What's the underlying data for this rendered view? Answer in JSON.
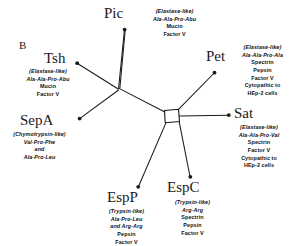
{
  "figure": {
    "panel_label": "B",
    "type": "unrooted-phylogenetic-tree",
    "line_color": "#1a1a1a",
    "text_color": "#111111"
  },
  "taxa": [
    {
      "id": "pic",
      "name": "Pic",
      "annotation": [
        "(Elastase-like)",
        "Ala-Ala-Pro-Abu",
        "Mucin",
        "Factor V"
      ],
      "italic_lines": [
        0,
        1
      ]
    },
    {
      "id": "tsh",
      "name": "Tsh",
      "annotation": [
        "(Elastase-like)",
        "Ala-Ala-Pro-Abu",
        "Mucin",
        "Factor V"
      ],
      "italic_lines": [
        0,
        1
      ]
    },
    {
      "id": "sepa",
      "name": "SepA",
      "annotation": [
        "(Chymotrypsin-like)",
        "Val-Pro-Phe",
        "and",
        "Ala-Pro-Leu"
      ],
      "italic_lines": [
        0,
        1,
        2,
        3
      ]
    },
    {
      "id": "espp",
      "name": "EspP",
      "annotation": [
        "(Trypsin-like)",
        "Ala-Pro-Leu",
        "and Arg-Arg",
        "Pepsin",
        "Factor V"
      ],
      "italic_lines": [
        0,
        1,
        2
      ]
    },
    {
      "id": "espc",
      "name": "EspC",
      "annotation": [
        "(Trypsin-like)",
        "Arg-Arg",
        "Spectrin",
        "Pepsin",
        "Factor V"
      ],
      "italic_lines": [
        0,
        1
      ]
    },
    {
      "id": "sat",
      "name": "Sat",
      "annotation": [
        "(Elastase-like)",
        "Ala-Ala-Pro-Val",
        "Spectrin",
        "Factor V",
        "Cytopathic to",
        "HEp-2 cells"
      ],
      "italic_lines": [
        0,
        1
      ]
    },
    {
      "id": "pet",
      "name": "Pet",
      "annotation": [
        "(Elastase-like)",
        "Ala-Ala-Pro-Ala",
        "Spectrin",
        "Pepsin",
        "Factor V",
        "Cytopathic to",
        "HEp-2 cells"
      ],
      "italic_lines": [
        0,
        1
      ]
    }
  ]
}
